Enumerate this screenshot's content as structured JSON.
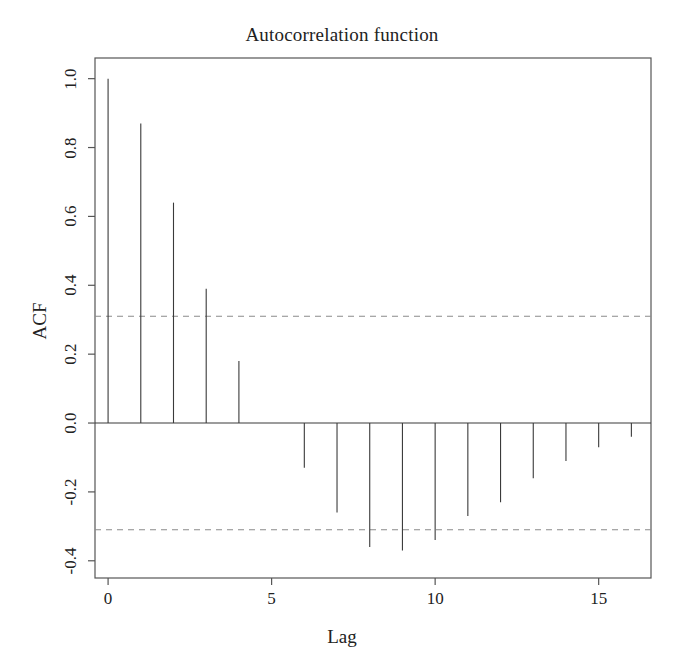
{
  "chart_data": {
    "type": "bar",
    "title": "Autocorrelation function",
    "xlabel": "Lag",
    "ylabel": "ACF",
    "grid": false,
    "legend": "none",
    "xlim": [
      -0.4,
      16.6
    ],
    "ylim": [
      -0.45,
      1.06
    ],
    "xticks": [
      0,
      5,
      10,
      15
    ],
    "xtick_labels": [
      "0",
      "5",
      "10",
      "15"
    ],
    "yticks": [
      1.0,
      0.8,
      0.6,
      0.4,
      0.2,
      0.0,
      -0.2,
      -0.4
    ],
    "ytick_labels": [
      "1.0",
      "0.8",
      "0.6",
      "0.4",
      "0.2",
      "0.0",
      "-0.2",
      "-0.4"
    ],
    "x": [
      0,
      1,
      2,
      3,
      4,
      5,
      6,
      7,
      8,
      9,
      10,
      11,
      12,
      13,
      14,
      15,
      16
    ],
    "values": [
      1.0,
      0.87,
      0.64,
      0.39,
      0.18,
      0.0,
      -0.13,
      -0.26,
      -0.36,
      -0.37,
      -0.34,
      -0.27,
      -0.23,
      -0.16,
      -0.11,
      -0.07,
      -0.04
    ],
    "confidence_bands": {
      "upper": 0.31,
      "lower": -0.31,
      "style": "dashed"
    },
    "zero_line": 0.0,
    "series_name": "ACF",
    "line_color": "#3a3a3a",
    "band_color": "#8a8a8a",
    "axis_color": "#555555"
  },
  "figure": {
    "title": "Autocorrelation function",
    "xlabel": "Lag",
    "ylabel": "ACF"
  }
}
